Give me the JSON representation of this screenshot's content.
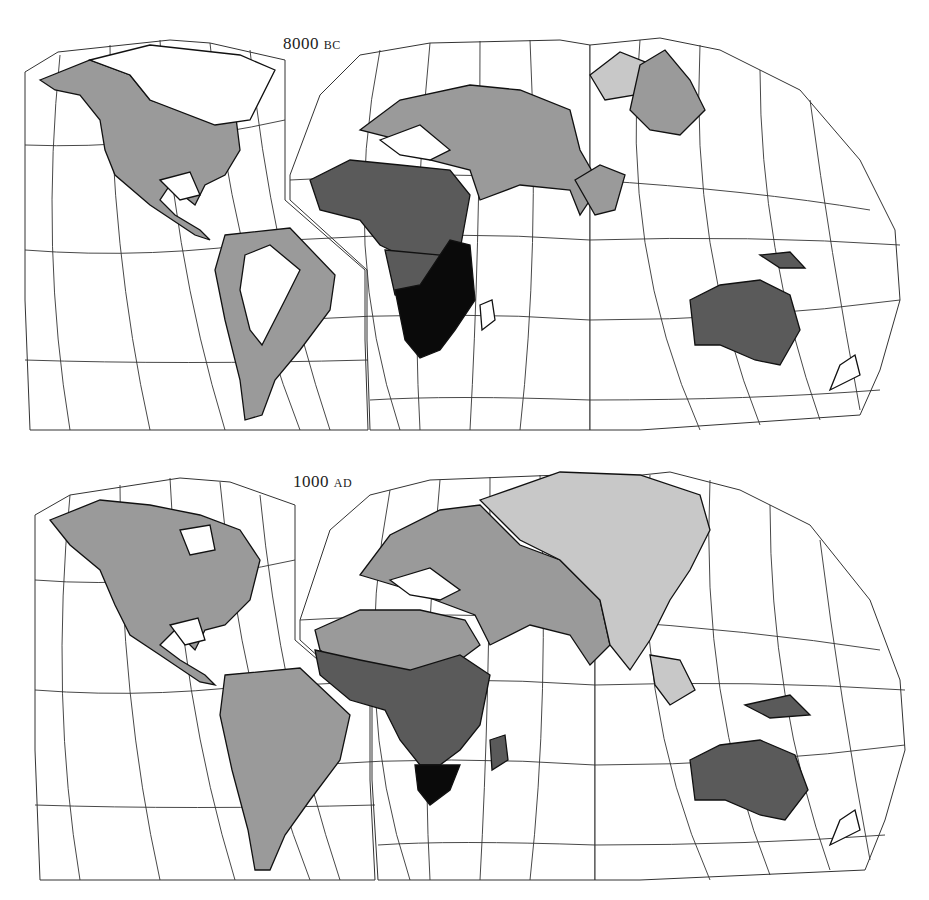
{
  "maps": [
    {
      "id": "top",
      "label_num": "8000",
      "label_era": "BC",
      "colors": {
        "light": "#c8c8c8",
        "mid": "#9a9a9a",
        "dark": "#5a5a5a",
        "black": "#0a0a0a"
      }
    },
    {
      "id": "bottom",
      "label_num": "1000",
      "label_era": "AD",
      "colors": {
        "light": "#c8c8c8",
        "mid": "#9a9a9a",
        "dark": "#5a5a5a",
        "black": "#0a0a0a"
      }
    }
  ]
}
